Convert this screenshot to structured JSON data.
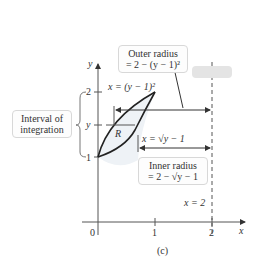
{
  "figure": {
    "caption": "(c)",
    "axes": {
      "x_label": "x",
      "y_label": "y",
      "x_ticks": [
        "0",
        "1",
        "2"
      ],
      "y_ticks": [
        "1",
        "y",
        "2"
      ]
    },
    "curves": {
      "upper": "x = (y − 1)²",
      "lower": "x = √y − 1"
    },
    "region_label": "R",
    "vertical_line": "x = 2",
    "outer_radius": {
      "line1": "Outer radius",
      "line2": "= 2 − (y − 1)²"
    },
    "inner_radius": {
      "line1": "Inner radius",
      "line2": "= 2 − √y − 1"
    },
    "interval": {
      "line1": "Interval of",
      "line2": "integration"
    }
  }
}
